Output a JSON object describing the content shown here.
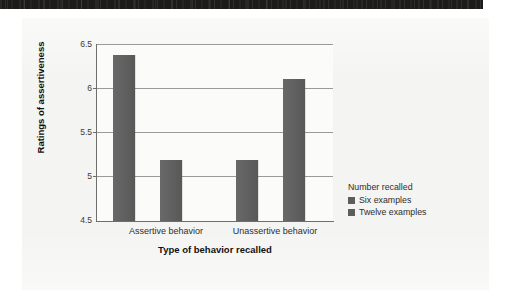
{
  "figure": {
    "background_color": "#f4f4f2",
    "plot_background_color": "#fbfbfa"
  },
  "scan_banner": {
    "name": "scan-artifact-banner",
    "color": "#1c1b1a"
  },
  "chart_data": {
    "type": "bar",
    "title": "",
    "xlabel": "Type of behavior recalled",
    "ylabel": "Ratings of assertiveness",
    "categories": [
      "Assertive behavior",
      "Unassertive behavior"
    ],
    "series": [
      {
        "name": "Six examples",
        "values": [
          6.38,
          5.19
        ],
        "color": "#5d5d5d"
      },
      {
        "name": "Twelve examples",
        "values": [
          5.19,
          6.1
        ],
        "color": "#5d5d5d"
      }
    ],
    "ylim": [
      4.5,
      6.5
    ],
    "yticks": [
      4.5,
      5,
      5.5,
      6,
      6.5
    ],
    "ytick_labels": [
      "4.5",
      "5",
      "5.5",
      "6",
      "6.5"
    ],
    "grid": true,
    "grid_axis": "y",
    "legend_position": "right",
    "legend_title": "Number recalled"
  },
  "axis": {
    "y_title": "Ratings of assertiveness",
    "x_title": "Type of behavior recalled",
    "ytick_0": "4.5",
    "ytick_1": "5",
    "ytick_2": "5.5",
    "ytick_3": "6",
    "ytick_4": "6.5",
    "cat_0": "Assertive behavior",
    "cat_1": "Unassertive behavior"
  },
  "legend": {
    "title": "Number recalled",
    "items": [
      {
        "label": "Six examples",
        "color": "#5d5d5d"
      },
      {
        "label": "Twelve examples",
        "color": "#5d5d5d"
      }
    ]
  }
}
